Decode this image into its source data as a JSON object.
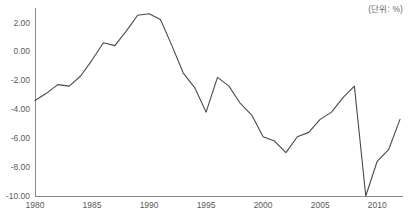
{
  "unit_label": "(단위: %)",
  "title_clipped": "",
  "colors": {
    "line": "#4a4a4a",
    "axis": "#8c8c8c",
    "tick_text": "#5a5a5a",
    "unit_text": "#6b6b6b",
    "background": "#ffffff"
  },
  "chart_data": {
    "type": "line",
    "title": "",
    "subtitle": "",
    "xlabel": "",
    "ylabel": "",
    "unit": "%",
    "grid": false,
    "legend": "none",
    "xlim": [
      1980,
      2012
    ],
    "ylim": [
      -10.0,
      3.0
    ],
    "xticks": [
      1980,
      1985,
      1990,
      1995,
      2000,
      2005,
      2010
    ],
    "xticklabels": [
      "1980",
      "1985",
      "1990",
      "1995",
      "2000",
      "2005",
      "2010"
    ],
    "yticks": [
      2.0,
      0.0,
      -2.0,
      -4.0,
      -6.0,
      -8.0,
      -10.0
    ],
    "yticklabels": [
      "2.00",
      "0.00",
      "-2.00",
      "-4.00",
      "-6.00",
      "-8.00",
      "-10.00"
    ],
    "x": [
      1980,
      1981,
      1982,
      1983,
      1984,
      1985,
      1986,
      1987,
      1988,
      1989,
      1990,
      1991,
      1992,
      1993,
      1994,
      1995,
      1996,
      1997,
      1998,
      1999,
      2000,
      2001,
      2002,
      2003,
      2004,
      2005,
      2006,
      2007,
      2008,
      2009,
      2010,
      2011,
      2012
    ],
    "values": [
      -3.4,
      -2.9,
      -2.3,
      -2.4,
      -1.7,
      -0.6,
      0.6,
      0.4,
      1.4,
      2.5,
      2.6,
      2.2,
      0.4,
      -1.5,
      -2.5,
      -4.2,
      -1.8,
      -2.4,
      -3.6,
      -4.4,
      -5.9,
      -6.2,
      -7.0,
      -5.9,
      -5.6,
      -4.7,
      -4.2,
      -3.2,
      -2.4,
      -10.0,
      -7.6,
      -6.8,
      -4.7
    ],
    "series": [
      {
        "name": "series-1",
        "values": [
          -3.4,
          -2.9,
          -2.3,
          -2.4,
          -1.7,
          -0.6,
          0.6,
          0.4,
          1.4,
          2.5,
          2.6,
          2.2,
          0.4,
          -1.5,
          -2.5,
          -4.2,
          -1.8,
          -2.4,
          -3.6,
          -4.4,
          -5.9,
          -6.2,
          -7.0,
          -5.9,
          -5.6,
          -4.7,
          -4.2,
          -3.2,
          -2.4,
          -10.0,
          -7.6,
          -6.8,
          -4.7
        ]
      }
    ]
  },
  "geometry": {
    "plot_left": 35,
    "plot_right": 400,
    "plot_top": 8,
    "plot_bottom": 196
  }
}
